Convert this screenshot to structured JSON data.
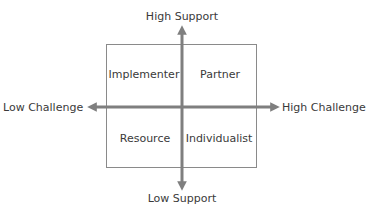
{
  "diagram": {
    "type": "quadrant-matrix",
    "axes": {
      "vertical": {
        "top_label": "High Support",
        "bottom_label": "Low Support"
      },
      "horizontal": {
        "left_label": "Low Challenge",
        "right_label": "High Challenge"
      }
    },
    "quadrants": {
      "top_left": "Implementer",
      "top_right": "Partner",
      "bottom_left": "Resource",
      "bottom_right": "Individualist"
    },
    "colors": {
      "axis": "#7f7f7f",
      "border": "#8a8a8a",
      "text": "#3a3a3a"
    }
  }
}
